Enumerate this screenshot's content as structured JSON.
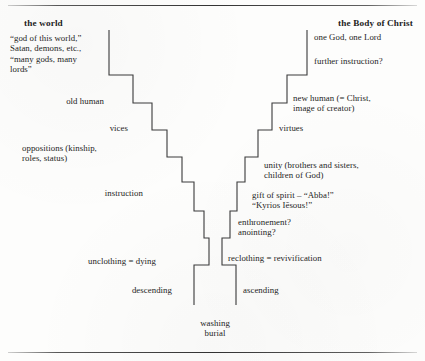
{
  "figure": {
    "headers": {
      "left": "the world",
      "right": "the Body of Christ"
    },
    "left_side": {
      "name": "descent",
      "steps": [
        {
          "id": "worldly-powers",
          "text": "“god of this world,”\nSatan, demons, etc.,\n“many gods, many\nlords”"
        },
        {
          "id": "old-human",
          "text": "old human"
        },
        {
          "id": "vices",
          "text": "vices"
        },
        {
          "id": "oppositions",
          "text": "oppositions (kinship,\nroles, status)"
        },
        {
          "id": "instruction",
          "text": "instruction"
        },
        {
          "id": "unclothing",
          "text": "unclothing = dying"
        },
        {
          "id": "descending",
          "text": "descending"
        }
      ]
    },
    "right_side": {
      "name": "ascent",
      "steps": [
        {
          "id": "one-god-one-lord",
          "text": "one God, one Lord"
        },
        {
          "id": "further-instruction",
          "text": "further instruction?"
        },
        {
          "id": "new-human",
          "text": "new human (= Christ,\nimage of creator)"
        },
        {
          "id": "virtues",
          "text": "virtues"
        },
        {
          "id": "unity",
          "text": "unity (brothers and sisters,\nchildren of God)"
        },
        {
          "id": "gift-of-spirit",
          "text": "gift of spirit – “Abba!”\n“Kyrios Iēsous!”"
        },
        {
          "id": "enthronement-anointing",
          "text": "enthronement?\nanointing?"
        },
        {
          "id": "reclothing",
          "text": "reclothing = revivification"
        },
        {
          "id": "ascending",
          "text": "ascending"
        }
      ]
    },
    "bottom": {
      "id": "washing-burial",
      "text": "washing\nburial"
    },
    "colors": {
      "ink": "#1d1d1d",
      "line": "#3a3a3a",
      "paper": "#fdfdfc"
    }
  }
}
